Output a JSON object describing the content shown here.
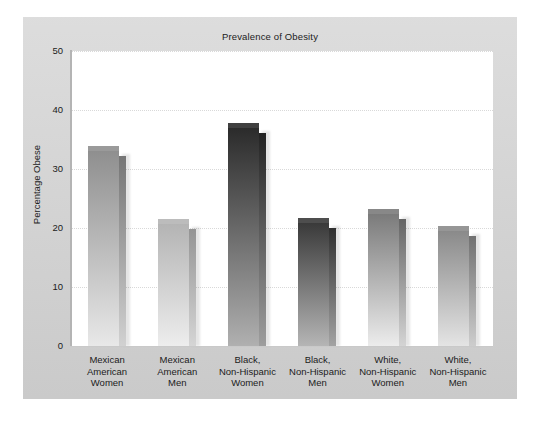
{
  "chart_data": {
    "type": "bar",
    "title": "Prevalence of Obesity",
    "xlabel": "",
    "ylabel": "Percentage Obese",
    "ylim": [
      0,
      50
    ],
    "yticks": [
      50,
      40,
      30,
      20,
      10,
      0
    ],
    "grid": "horizontal dotted gridlines at 10, 20, 30, 40, 50",
    "legend": "none",
    "categories": [
      "Mexican American Women",
      "Mexican American Men",
      "Black, Non-Hispanic Women",
      "Black, Non-Hispanic Men",
      "White, Non-Hispanic Women",
      "White, Non-Hispanic Men"
    ],
    "category_lines": [
      [
        "Mexican",
        "American",
        "Women"
      ],
      [
        "Mexican",
        "American",
        "Men"
      ],
      [
        "Black,",
        "Non-Hispanic",
        "Women"
      ],
      [
        "Black,",
        "Non-Hispanic",
        "Men"
      ],
      [
        "White,",
        "Non-Hispanic",
        "Women"
      ],
      [
        "White,",
        "Non-Hispanic",
        "Men"
      ]
    ],
    "values": [
      33.0,
      20.7,
      36.9,
      20.8,
      22.3,
      19.5
    ],
    "bar_colors_top": [
      "#8f8f8f",
      "#b4b4b4",
      "#2b2b2b",
      "#3a3a3a",
      "#7b7b7b",
      "#8a8a8a"
    ],
    "bar_colors_bottom": [
      "#e8e8e8",
      "#ededed",
      "#b0b0b0",
      "#b5b5b5",
      "#ececec",
      "#e4e4e4"
    ]
  },
  "style": {
    "frame_color": "#d3d3d3",
    "plot_background": "#ffffff",
    "gridline_color": "#d9d9d9",
    "axis_color": "#b4b4b4",
    "text_color": "#1b1b1b"
  }
}
